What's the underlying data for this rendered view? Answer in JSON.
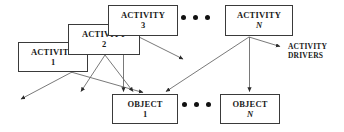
{
  "diagram": {
    "canvas": {
      "width": 344,
      "height": 132
    },
    "colors": {
      "background": "#ffffff",
      "box_border": "#3a3a3a",
      "edge": "#6a6a6a",
      "text": "#1a1a1a",
      "dot": "#111111"
    },
    "nodes": [
      {
        "id": "activity1",
        "title": "ACTIVITY",
        "index": "1",
        "index_italic": false,
        "x": 18,
        "y": 42,
        "w": 70,
        "h": 30
      },
      {
        "id": "activity2",
        "title": "ACTIVITY",
        "index": "2",
        "index_italic": false,
        "x": 68,
        "y": 24,
        "w": 72,
        "h": 31
      },
      {
        "id": "activity3",
        "title": "ACTIVITY",
        "index": "3",
        "index_italic": false,
        "x": 108,
        "y": 5,
        "w": 70,
        "h": 31
      },
      {
        "id": "activityN",
        "title": "ACTIVITY",
        "index": "N",
        "index_italic": true,
        "x": 225,
        "y": 5,
        "w": 68,
        "h": 31
      },
      {
        "id": "object1",
        "title": "OBJECT",
        "index": "1",
        "index_italic": false,
        "x": 112,
        "y": 94,
        "w": 66,
        "h": 30
      },
      {
        "id": "objectN",
        "title": "OBJECT",
        "index": "N",
        "index_italic": true,
        "x": 220,
        "y": 94,
        "w": 60,
        "h": 30
      }
    ],
    "ellipses": [
      {
        "id": "activity-ellipsis",
        "x": 181,
        "y": 15,
        "count": 3
      },
      {
        "id": "object-ellipsis",
        "x": 182,
        "y": 102,
        "count": 3
      }
    ],
    "labels": [
      {
        "id": "activity-drivers",
        "line1": "ACTIVITY",
        "line2": "DRIVERS",
        "x": 288,
        "y": 42
      }
    ],
    "edges": [
      {
        "id": "activity1-to-left",
        "from": "activity1",
        "to": "external-left",
        "path": "M 72 72 L 20 100"
      },
      {
        "id": "activity1-to-object1",
        "from": "activity1",
        "to": "object1",
        "path": "M 72 72 L 146 93"
      },
      {
        "id": "activity2-to-object1-left",
        "from": "activity2",
        "to": "object1",
        "path": "M 104 55 L 80 92"
      },
      {
        "id": "activity2-to-object1-right",
        "from": "activity2",
        "to": "object1",
        "path": "M 104 55 L 134 92"
      },
      {
        "id": "activity3-to-object1",
        "from": "activity3",
        "to": "object1",
        "path": "M 124 36 L 124 92"
      },
      {
        "id": "activity3-to-right",
        "from": "activity3",
        "to": "external-right",
        "path": "M 138 36 L 180 58"
      },
      {
        "id": "activityN-to-object1",
        "from": "activityN",
        "to": "object1",
        "path": "M 250 37 L 166 92"
      },
      {
        "id": "activityN-to-objectN",
        "from": "activityN",
        "to": "objectN",
        "path": "M 250 37 L 250 92"
      },
      {
        "id": "activityN-to-drivers",
        "from": "activityN",
        "to": "activity-drivers",
        "path": "M 250 37 L 282 47"
      }
    ]
  }
}
